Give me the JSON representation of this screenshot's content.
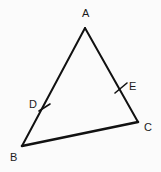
{
  "figure": {
    "kind": "geometry-diagram",
    "shape": "triangle",
    "background_color": "#fbfbfb",
    "stroke_color": "#111111",
    "label_color": "#1a1a1a",
    "canvas": {
      "width": 161,
      "height": 172
    },
    "vertices": [
      {
        "id": "A",
        "label": "A",
        "x": 85,
        "y": 28,
        "label_x": 82,
        "label_y": 8
      },
      {
        "id": "B",
        "label": "B",
        "x": 22,
        "y": 146,
        "label_x": 10,
        "label_y": 152
      },
      {
        "id": "C",
        "label": "C",
        "x": 138,
        "y": 122,
        "label_x": 144,
        "label_y": 122
      }
    ],
    "sides": [
      {
        "id": "AB",
        "from": "A",
        "to": "B",
        "stroke_width": 2
      },
      {
        "id": "AC",
        "from": "A",
        "to": "C",
        "stroke_width": 2
      },
      {
        "id": "BC",
        "from": "B",
        "to": "C",
        "stroke_width": 2.6
      }
    ],
    "marked_points": [
      {
        "id": "D",
        "label": "D",
        "on_side": "AB",
        "x": 44,
        "y": 107,
        "label_x": 29,
        "label_y": 99,
        "tick": {
          "x1": 39,
          "y1": 111,
          "x2": 50,
          "y2": 104,
          "stroke_width": 1.6
        }
      },
      {
        "id": "E",
        "label": "E",
        "on_side": "AC",
        "x": 121,
        "y": 88,
        "label_x": 129,
        "label_y": 81,
        "tick": {
          "x1": 115,
          "y1": 93,
          "x2": 127,
          "y2": 83,
          "stroke_width": 1.6
        }
      }
    ]
  }
}
